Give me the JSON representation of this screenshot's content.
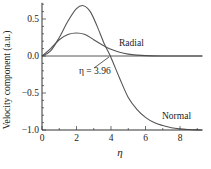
{
  "chart_data": {
    "type": "line",
    "title": "",
    "xlabel": "η",
    "ylabel": "Velocity component (a.u.)",
    "xlim": [
      0,
      9.3
    ],
    "ylim": [
      -1.0,
      0.72
    ],
    "xticks": [
      0,
      2,
      4,
      6,
      8
    ],
    "xtick_labels": [
      "0",
      "2",
      "4",
      "6",
      "8"
    ],
    "yticks": [
      -1.0,
      -0.5,
      0.0,
      0.5
    ],
    "ytick_labels": [
      "−1.0",
      "−0.5",
      "0.0",
      "0.5"
    ],
    "grid": false,
    "legend": "none (inline labels)",
    "series": [
      {
        "name": "Normal",
        "x": [
          0,
          0.5,
          1.0,
          1.5,
          2.0,
          2.4,
          2.8,
          3.2,
          3.6,
          3.96,
          4.5,
          5.0,
          5.5,
          6.0,
          6.5,
          7.0,
          7.5,
          8.0,
          8.5,
          9.0,
          9.3
        ],
        "values": [
          0,
          0.07,
          0.25,
          0.47,
          0.64,
          0.68,
          0.6,
          0.4,
          0.17,
          0.0,
          -0.3,
          -0.56,
          -0.72,
          -0.83,
          -0.9,
          -0.94,
          -0.97,
          -0.985,
          -0.993,
          -0.998,
          -1.0
        ]
      },
      {
        "name": "Radial",
        "x": [
          0,
          0.5,
          1.0,
          1.5,
          2.0,
          2.5,
          3.0,
          3.5,
          4.0,
          4.5,
          5.0,
          5.5,
          6.0,
          7.0,
          8.0,
          9.3
        ],
        "values": [
          0,
          0.1,
          0.22,
          0.29,
          0.31,
          0.29,
          0.22,
          0.15,
          0.09,
          0.05,
          0.025,
          0.012,
          0.005,
          0.001,
          0.0,
          0.0
        ]
      }
    ],
    "annotations": [
      {
        "text": "η = 3.96",
        "points_to": {
          "x": 3.96,
          "y": 0.0
        }
      },
      {
        "text": "Radial",
        "near_series": "Radial"
      },
      {
        "text": "Normal",
        "near_series": "Normal"
      }
    ]
  },
  "labels": {
    "xlabel": "η",
    "ylabel": "Velocity component (a.u.)",
    "annotation": "η = 3.96",
    "radial": "Radial",
    "normal": "Normal"
  }
}
